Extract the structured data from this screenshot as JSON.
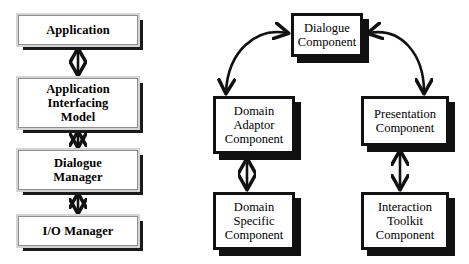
{
  "diagram": {
    "type": "block-diagram",
    "background": "#ffffff",
    "ink": "#111111",
    "frame_color": "#d6d4d2",
    "shadow_color": "#1a1a1a"
  },
  "left_model": {
    "name": "Layered interface model",
    "nodes": [
      {
        "id": "application",
        "label": "Application",
        "lines": [
          "Application"
        ],
        "x": 18,
        "y": 15,
        "w": 120,
        "h": 30
      },
      {
        "id": "application-interfacing-model",
        "label": "Application Interfacing Model",
        "lines": [
          "Application",
          "Interfacing",
          "Model"
        ],
        "x": 18,
        "y": 78,
        "w": 120,
        "h": 50
      },
      {
        "id": "dialogue-manager",
        "label": "Dialogue Manager",
        "lines": [
          "Dialogue",
          "Manager"
        ],
        "x": 18,
        "y": 150,
        "w": 120,
        "h": 40
      },
      {
        "id": "io-manager",
        "label": "I/O Manager",
        "lines": [
          "I/O Manager"
        ],
        "x": 18,
        "y": 216,
        "w": 120,
        "h": 30
      }
    ],
    "connectors": [
      {
        "from": "application",
        "to": "application-interfacing-model",
        "kind": "straight",
        "heads": "both"
      },
      {
        "from": "application-interfacing-model",
        "to": "dialogue-manager",
        "kind": "straight",
        "heads": "both"
      },
      {
        "from": "dialogue-manager",
        "to": "io-manager",
        "kind": "straight",
        "heads": "both"
      }
    ]
  },
  "right_model": {
    "name": "Arch / Seeheim component model",
    "nodes": [
      {
        "id": "dialogue-component",
        "label": "Dialogue Component",
        "lines": [
          "Dialogue",
          "Component"
        ],
        "x": 291,
        "y": 13,
        "w": 72,
        "h": 44
      },
      {
        "id": "domain-adaptor-component",
        "label": "Domain Adaptor Component",
        "lines": [
          "Domain",
          "Adaptor",
          "Component"
        ],
        "x": 213,
        "y": 96,
        "w": 82,
        "h": 58
      },
      {
        "id": "presentation-component",
        "label": "Presentation Component",
        "lines": [
          "Presentation",
          "Component"
        ],
        "x": 361,
        "y": 96,
        "w": 88,
        "h": 50
      },
      {
        "id": "domain-specific-component",
        "label": "Domain Specific Component",
        "lines": [
          "Domain",
          "Specific",
          "Component"
        ],
        "x": 213,
        "y": 192,
        "w": 82,
        "h": 58
      },
      {
        "id": "interaction-toolkit-component",
        "label": "Interaction Toolkit Component",
        "lines": [
          "Interaction",
          "Toolkit",
          "Component"
        ],
        "x": 361,
        "y": 192,
        "w": 88,
        "h": 58
      }
    ],
    "connectors": [
      {
        "from": "dialogue-component",
        "to": "domain-adaptor-component",
        "kind": "curved",
        "heads": "both"
      },
      {
        "from": "dialogue-component",
        "to": "presentation-component",
        "kind": "curved",
        "heads": "both"
      },
      {
        "from": "domain-adaptor-component",
        "to": "domain-specific-component",
        "kind": "straight",
        "heads": "both"
      },
      {
        "from": "presentation-component",
        "to": "interaction-toolkit-component",
        "kind": "straight",
        "heads": "both"
      }
    ]
  }
}
